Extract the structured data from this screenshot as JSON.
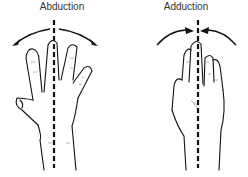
{
  "figure": {
    "panels": [
      {
        "label": "Abduction",
        "motion": "fingers spread apart from midline",
        "arrows": "outward"
      },
      {
        "label": "Adduction",
        "motion": "fingers brought together toward midline",
        "arrows": "inward"
      }
    ],
    "colors": {
      "line": "#111111",
      "text": "#333333",
      "background": "#ffffff"
    }
  }
}
